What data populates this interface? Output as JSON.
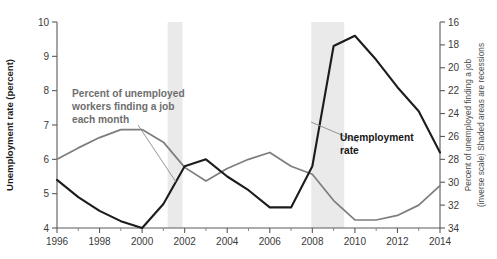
{
  "chart_data": {
    "type": "line",
    "title": "",
    "xlabel": "",
    "ylabel": "Unemployment rate (percent)",
    "ylabel_right": "Percent of unemployed finding a job (inverse scale) Shaded areas are recessions",
    "ylabel_right_line1": "Percent of unemployed finding a job",
    "ylabel_right_line2": "(inverse scale) Shaded areas are recessions",
    "xlim": [
      1996,
      2014
    ],
    "ylim": [
      4,
      10
    ],
    "ylim_right": [
      34,
      16
    ],
    "right_axis_inverted": true,
    "grid": false,
    "legend": "annotations",
    "xticks": [
      1996,
      1998,
      2000,
      2002,
      2004,
      2006,
      2008,
      2010,
      2012,
      2014
    ],
    "xtick_labels": [
      "1996",
      "1998",
      "2000",
      "2002",
      "2004",
      "2006",
      "2008",
      "2010",
      "2012",
      "2014"
    ],
    "xticks_minor": [
      1997,
      1999,
      2001,
      2003,
      2005,
      2007,
      2009,
      2011,
      2013
    ],
    "yticks_left": [
      4,
      5,
      6,
      7,
      8,
      9,
      10
    ],
    "ytick_labels_left": [
      "4",
      "5",
      "6",
      "7",
      "8",
      "9",
      "10"
    ],
    "yticks_right": [
      16,
      18,
      20,
      22,
      24,
      26,
      28,
      30,
      32,
      34
    ],
    "ytick_labels_right": [
      "16",
      "18",
      "20",
      "22",
      "24",
      "26",
      "28",
      "30",
      "32",
      "34"
    ],
    "series": [
      {
        "name": "Percent of unemployed workers finding a job each month",
        "axis": "right",
        "color": "#7d7d7d",
        "width": 1.7,
        "x": [
          1996,
          1997,
          1998,
          1999,
          2000,
          2001,
          2002,
          2003,
          2004,
          2005,
          2006,
          2007,
          2008,
          2009,
          2010,
          2011,
          2012,
          2013,
          2014
        ],
        "values": [
          28.0,
          27.0,
          26.1,
          25.4,
          25.4,
          26.5,
          28.7,
          29.9,
          28.8,
          28.0,
          27.4,
          28.6,
          29.3,
          31.6,
          33.3,
          33.3,
          32.9,
          32.0,
          30.3
        ]
      },
      {
        "name": "Unemployment rate",
        "axis": "left",
        "color": "#1c1c1c",
        "width": 2.1,
        "x": [
          1996,
          1997,
          1998,
          1999,
          2000,
          2001,
          2002,
          2003,
          2004,
          2005,
          2006,
          2007,
          2008,
          2009,
          2010,
          2011,
          2012,
          2013,
          2014
        ],
        "values": [
          5.4,
          4.9,
          4.5,
          4.2,
          4.0,
          4.7,
          5.8,
          6.0,
          5.5,
          5.1,
          4.6,
          4.6,
          5.8,
          9.3,
          9.6,
          8.9,
          8.1,
          7.4,
          6.2
        ]
      }
    ],
    "recessions": [
      {
        "label": "2001 recession",
        "start": 2001.2,
        "end": 2001.9,
        "color": "#eaeaea"
      },
      {
        "label": "2008-2009 recession",
        "start": 2007.95,
        "end": 2009.5,
        "color": "#eaeaea"
      }
    ],
    "annotations": [
      {
        "name": "job-finding-annotation",
        "lines": [
          "Percent of unemployed",
          "workers finding a job",
          "each month"
        ],
        "color": "#6e6e6e",
        "leader": {
          "x1": 138,
          "y1": 125,
          "x2": 176,
          "y2": 182
        }
      },
      {
        "name": "unemployment-rate-annotation",
        "lines": [
          "Unemployment",
          "rate"
        ],
        "color": "#161616",
        "leader": {
          "x1": 311,
          "y1": 122,
          "x2": 358,
          "y2": 142
        }
      }
    ]
  }
}
